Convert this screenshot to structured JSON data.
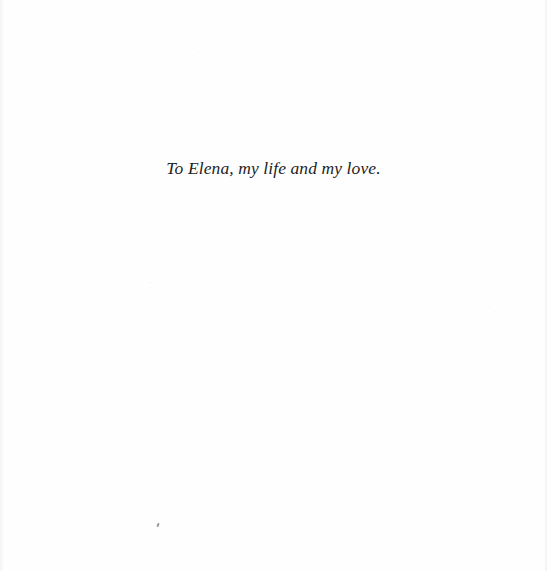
{
  "page": {
    "dedication": "To Elena, my life and my love."
  }
}
